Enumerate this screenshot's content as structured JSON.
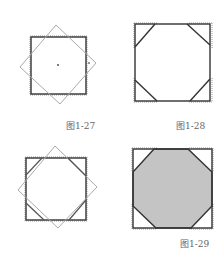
{
  "figures": [
    {
      "id": "fig-1-27",
      "label": "图1-27"
    },
    {
      "id": "fig-1-28",
      "label": "图1-28"
    },
    {
      "id": "fig-unlabeled",
      "label": ""
    },
    {
      "id": "fig-1-29",
      "label": "图1-29"
    }
  ],
  "colors": {
    "square_stroke": "#333333",
    "rotated_stroke": "#aaaaaa",
    "dotted_stroke": "#999999",
    "fill_octagon": "#c4c4c4"
  }
}
